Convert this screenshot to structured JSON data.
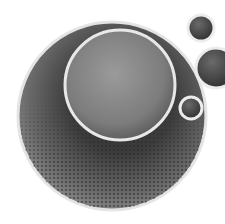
{
  "graphic": {
    "description": "Abstract grayscale circles with halftone texture",
    "colors": {
      "background": "#ffffff",
      "disc_dark": "#3a3a3a",
      "disc_mid": "#6e6e6e",
      "inner_fill": "#8a8a8a",
      "rim": "#e6e6e6"
    }
  }
}
